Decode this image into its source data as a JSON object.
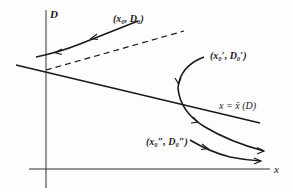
{
  "diagram": {
    "axes": {
      "y_label": "D",
      "x_label": "x"
    },
    "curves": {
      "line_label": "x = x̄ (D)",
      "point_1": "(x₀, D₀)",
      "point_2": "(x₀′, D₀′)",
      "point_3": "(x₀″, D₀″)"
    },
    "colors": {
      "ink": "#1a1a1a",
      "background": "#fdfdfd"
    }
  }
}
